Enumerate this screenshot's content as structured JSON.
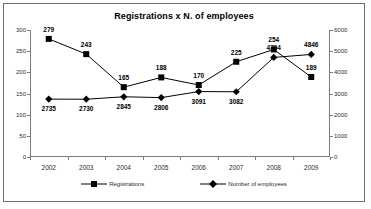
{
  "chart_data": {
    "type": "line",
    "title": "Registrations x N. of employees",
    "xlabel": "",
    "ylabel": "",
    "grid": false,
    "legend_position": "bottom",
    "categories": [
      "2002",
      "2003",
      "2004",
      "2005",
      "2006",
      "2007",
      "2008",
      "2009"
    ],
    "axes": {
      "left": {
        "ylim": [
          0,
          300
        ],
        "ticks": [
          0,
          50,
          100,
          150,
          200,
          250,
          300
        ],
        "tick_labels": [
          "0",
          "50",
          "100",
          "150",
          "200",
          "250",
          "300"
        ]
      },
      "right": {
        "ylim": [
          0,
          6000
        ],
        "ticks": [
          0,
          1000,
          2000,
          3000,
          4000,
          5000,
          6000
        ],
        "tick_labels": [
          "0",
          "1000",
          "2000",
          "3000",
          "4000",
          "5000",
          "6000"
        ]
      }
    },
    "series": [
      {
        "name": "Registrations",
        "axis": "left",
        "marker": "square",
        "color": "#000000",
        "values": [
          279,
          243,
          165,
          188,
          170,
          225,
          254,
          189
        ],
        "data_labels": [
          "279",
          "243",
          "165",
          "188",
          "170",
          "225",
          "254",
          "189"
        ]
      },
      {
        "name": "Number of employees",
        "axis": "right",
        "marker": "diamond",
        "color": "#000000",
        "values": [
          2735,
          2730,
          2845,
          2806,
          3091,
          3082,
          4704,
          4846
        ],
        "data_labels": [
          "2735",
          "2730",
          "2845",
          "2806",
          "3091",
          "3082",
          "4704",
          "4846"
        ]
      }
    ]
  },
  "legend": {
    "items": [
      {
        "label": "Registrations"
      },
      {
        "label": "Number of employees"
      }
    ]
  }
}
